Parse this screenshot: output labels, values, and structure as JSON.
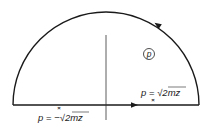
{
  "diagram": {
    "type": "contour-integration",
    "colors": {
      "line": "#1a1a1a",
      "axis": "#333333",
      "text": "#222222",
      "background": "#ffffff"
    },
    "plane_label": "p",
    "contour": {
      "shape": "semicircle-upper-half-plane",
      "direction": "counter-clockwise"
    },
    "poles": [
      {
        "marker": "×",
        "label_var": "p",
        "label_eq": " = ",
        "label_sign": "−",
        "label_radical": "√",
        "label_radicand": "2mz"
      },
      {
        "marker": "×",
        "label_var": "p",
        "label_eq": " = ",
        "label_sign": "",
        "label_radical": "√",
        "label_radicand": "2mz"
      }
    ]
  }
}
